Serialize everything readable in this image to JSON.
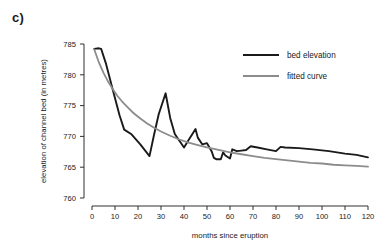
{
  "panel": {
    "label": "c)"
  },
  "chart_data": {
    "type": "line",
    "title": "",
    "xlabel": "months since eruption",
    "ylabel": "elevation of channel bed (in metres)",
    "xlim": [
      0,
      120
    ],
    "ylim": [
      760,
      785
    ],
    "xticks": [
      0,
      10,
      20,
      30,
      40,
      50,
      60,
      70,
      80,
      90,
      100,
      110,
      120
    ],
    "yticks": [
      760,
      765,
      770,
      775,
      780,
      785
    ],
    "grid": false,
    "legend_position": "top-right",
    "series": [
      {
        "name": "bed elevation",
        "color": "#1a1a1a",
        "width": 1.9,
        "x": [
          1,
          3,
          4,
          6,
          9,
          12,
          14,
          17,
          21,
          25,
          27,
          29,
          32,
          34,
          36,
          38,
          40,
          42,
          44,
          45,
          46,
          48,
          50,
          52,
          53,
          54,
          56,
          57,
          58,
          60,
          61,
          63,
          65,
          67,
          69,
          72,
          76,
          80,
          82,
          84,
          90,
          96,
          103,
          110,
          115,
          120
        ],
        "y": [
          784.2,
          784.3,
          784.2,
          781.9,
          777.6,
          773.4,
          771.1,
          770.4,
          768.7,
          766.8,
          770.3,
          773.6,
          777.0,
          773.0,
          770.4,
          769.3,
          768.2,
          769.4,
          770.6,
          771.2,
          769.8,
          768.7,
          768.9,
          767.6,
          766.5,
          766.3,
          766.3,
          767.4,
          766.9,
          766.4,
          767.9,
          767.6,
          767.7,
          767.8,
          768.4,
          768.2,
          767.9,
          767.6,
          768.3,
          768.2,
          768.1,
          767.9,
          767.6,
          767.2,
          767.0,
          766.6
        ]
      },
      {
        "name": "fitted curve",
        "color": "#8c8c8c",
        "width": 1.8,
        "x": [
          1,
          3,
          5,
          7,
          9,
          11,
          13,
          15,
          18,
          21,
          24,
          27,
          30,
          34,
          38,
          42,
          46,
          50,
          55,
          60,
          65,
          70,
          75,
          80,
          85,
          90,
          95,
          100,
          105,
          110,
          115,
          120
        ],
        "y": [
          784.1,
          782.0,
          780.3,
          778.9,
          777.7,
          776.6,
          775.7,
          774.9,
          773.8,
          772.9,
          772.1,
          771.4,
          770.8,
          770.1,
          769.5,
          769.0,
          768.6,
          768.2,
          767.8,
          767.4,
          767.1,
          766.8,
          766.5,
          766.3,
          766.1,
          765.9,
          765.7,
          765.6,
          765.4,
          765.3,
          765.2,
          765.1
        ]
      }
    ]
  }
}
